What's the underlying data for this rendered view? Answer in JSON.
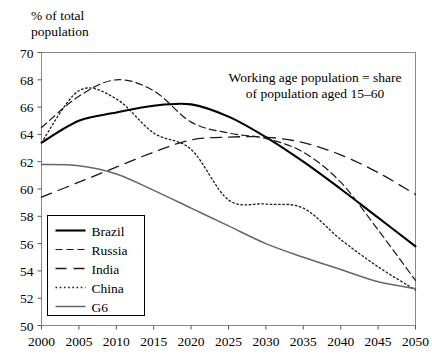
{
  "axis_title": "% of total\npopulation",
  "annotation": {
    "line1": "Working age population = share",
    "line2": "of population aged 15–60"
  },
  "legend": {
    "items": [
      {
        "label": "Brazil",
        "style": "solid-thick",
        "color": "#000000"
      },
      {
        "label": "Russia",
        "style": "dashed",
        "color": "#1a1a1a"
      },
      {
        "label": "India",
        "style": "long-dashed",
        "color": "#1a1a1a"
      },
      {
        "label": "China",
        "style": "dotted",
        "color": "#1a1a1a"
      },
      {
        "label": "G6",
        "style": "solid-gray",
        "color": "#666666"
      }
    ]
  },
  "chart_data": {
    "type": "line",
    "title": "",
    "subtitle": "",
    "xlabel": "",
    "ylabel": "% of total population",
    "xlim": [
      2000,
      2050
    ],
    "ylim": [
      50,
      70
    ],
    "xticks": [
      2000,
      2005,
      2010,
      2015,
      2020,
      2025,
      2030,
      2035,
      2040,
      2045,
      2050
    ],
    "yticks": [
      50,
      52,
      54,
      56,
      58,
      60,
      62,
      64,
      66,
      68,
      70
    ],
    "grid": false,
    "legend_position": "bottom-left",
    "annotation": "Working age population = share of population aged 15–60",
    "x": [
      2000,
      2005,
      2010,
      2015,
      2020,
      2025,
      2030,
      2035,
      2040,
      2045,
      2050
    ],
    "series": [
      {
        "name": "Brazil",
        "color": "#000000",
        "style": "solid-thick",
        "values": [
          63.4,
          65.0,
          65.6,
          66.1,
          66.2,
          65.3,
          63.8,
          62.0,
          60.0,
          57.9,
          55.8
        ]
      },
      {
        "name": "Russia",
        "color": "#1a1a1a",
        "style": "dashed",
        "values": [
          64.5,
          66.8,
          68.0,
          67.2,
          64.9,
          64.1,
          63.7,
          62.7,
          60.5,
          57.0,
          53.3
        ]
      },
      {
        "name": "India",
        "color": "#1a1a1a",
        "style": "long-dashed",
        "values": [
          59.4,
          60.5,
          61.6,
          62.7,
          63.6,
          63.8,
          63.8,
          63.4,
          62.5,
          61.2,
          59.6
        ]
      },
      {
        "name": "China",
        "color": "#1a1a1a",
        "style": "dotted",
        "values": [
          63.4,
          67.2,
          66.6,
          64.1,
          62.9,
          59.2,
          58.9,
          58.6,
          56.3,
          54.3,
          52.6
        ]
      },
      {
        "name": "G6",
        "color": "#666666",
        "style": "solid-gray",
        "values": [
          61.8,
          61.7,
          61.1,
          59.9,
          58.6,
          57.3,
          56.0,
          55.0,
          54.1,
          53.2,
          52.7
        ]
      }
    ]
  }
}
